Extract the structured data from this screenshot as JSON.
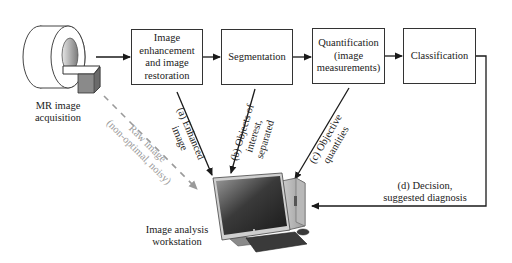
{
  "diagram": {
    "type": "flowchart",
    "title": "",
    "source_node": {
      "id": "mr-scanner",
      "label_lines": [
        "MR image",
        "acquisition"
      ],
      "icon": "mri-scanner-icon"
    },
    "pipeline": [
      {
        "id": "enhancement",
        "label_lines": [
          "Image",
          "enhancement",
          "and image",
          "restoration"
        ]
      },
      {
        "id": "segmentation",
        "label_lines": [
          "Segmentation"
        ]
      },
      {
        "id": "quantification",
        "label_lines": [
          "Quantification",
          "(image",
          "measurements)"
        ]
      },
      {
        "id": "classification",
        "label_lines": [
          "Classification"
        ]
      }
    ],
    "target_node": {
      "id": "workstation",
      "label_lines": [
        "Image analysis",
        "workstation"
      ],
      "icon": "computer-workstation-icon"
    },
    "edges": [
      {
        "from": "mr-scanner",
        "to": "enhancement",
        "style": "solid"
      },
      {
        "from": "enhancement",
        "to": "segmentation",
        "style": "solid"
      },
      {
        "from": "segmentation",
        "to": "quantification",
        "style": "solid"
      },
      {
        "from": "quantification",
        "to": "classification",
        "style": "solid"
      },
      {
        "from": "enhancement",
        "to": "workstation",
        "style": "solid",
        "label_lines": [
          "(a) Enhanced",
          "image"
        ]
      },
      {
        "from": "segmentation",
        "to": "workstation",
        "style": "solid",
        "label_lines": [
          "(b) Objects of",
          "interest,",
          "separated"
        ]
      },
      {
        "from": "quantification",
        "to": "workstation",
        "style": "solid",
        "label_lines": [
          "(c) Objective",
          "quantities"
        ]
      },
      {
        "from": "classification",
        "to": "workstation",
        "style": "solid",
        "label_lines": [
          "(d) Decision,",
          "suggested diagnosis"
        ]
      },
      {
        "from": "mr-scanner",
        "to": "workstation",
        "style": "dashed",
        "color": "#9a9a9a",
        "label_lines": [
          "Raw image",
          "(non-optimal, noisy)"
        ]
      }
    ]
  },
  "labels": {
    "mr": "MR image\nacquisition",
    "enhancement": "Image\nenhancement\nand image\nrestoration",
    "segmentation": "Segmentation",
    "quantification": "Quantification\n(image\nmeasurements)",
    "classification": "Classification",
    "workstation": "Image analysis\nworkstation",
    "edge_a": "(a) Enhanced\nimage",
    "edge_b": "(b) Objects of\ninterest,\nseparated",
    "edge_c": "(c) Objective\nquantities",
    "edge_d": "(d) Decision,\nsuggested diagnosis",
    "raw": "Raw image\n(non-optimal, noisy)"
  },
  "colors": {
    "line": "#1a1a1a",
    "dashed": "#9a9a9a",
    "box_border": "#333333"
  }
}
